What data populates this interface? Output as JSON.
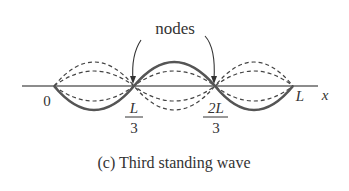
{
  "diagram": {
    "annotation_label": "nodes",
    "axis_label": "x",
    "tick_labels": {
      "origin": "0",
      "one_third_num": "L",
      "one_third_den": "3",
      "two_thirds_num": "2L",
      "two_thirds_den": "3",
      "end": "L"
    },
    "caption": "(c) Third standing wave",
    "colors": {
      "solid_wave": "#555555",
      "dashed_wave": "#444444",
      "axis": "#666666",
      "text": "#333333"
    }
  }
}
